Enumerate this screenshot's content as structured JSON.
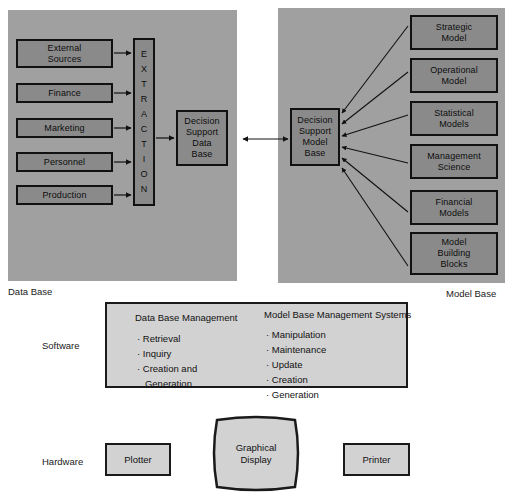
{
  "diagram": {
    "colors": {
      "panel_fill": "#a0a0a0",
      "dark_box_fill": "#8a8a8a",
      "light_box_fill": "#d2d2d2",
      "stroke": "#111111",
      "background": "#ffffff"
    }
  },
  "row_labels": {
    "software": "Software",
    "hardware": "Hardware"
  },
  "data_base": {
    "caption": "Data Base",
    "sources": [
      {
        "label_line1": "External",
        "label_line2": "Sources"
      },
      {
        "label_line1": "Finance",
        "label_line2": ""
      },
      {
        "label_line1": "Marketing",
        "label_line2": ""
      },
      {
        "label_line1": "Personnel",
        "label_line2": ""
      },
      {
        "label_line1": "Production",
        "label_line2": ""
      }
    ],
    "extraction": {
      "label": "EXTRACTION",
      "letters": [
        "E",
        "X",
        "T",
        "R",
        "A",
        "C",
        "T",
        "I",
        "O",
        "N"
      ]
    },
    "store": {
      "line1": "Decision",
      "line2": "Support",
      "line3": "Data",
      "line4": "Base"
    }
  },
  "model_base": {
    "caption": "Model Base",
    "store": {
      "line1": "Decision",
      "line2": "Support",
      "line3": "Model",
      "line4": "Base"
    },
    "models": [
      {
        "line1": "Strategic",
        "line2": "Model",
        "line3": ""
      },
      {
        "line1": "Operational",
        "line2": "Model",
        "line3": ""
      },
      {
        "line1": "Statistical",
        "line2": "Models",
        "line3": ""
      },
      {
        "line1": "Management",
        "line2": "Science",
        "line3": ""
      },
      {
        "line1": "Financial",
        "line2": "Models",
        "line3": ""
      },
      {
        "line1": "Model",
        "line2": "Building",
        "line3": "Blocks"
      }
    ]
  },
  "software": {
    "left_column": {
      "title": "Data Base Management",
      "items": [
        "Retrieval",
        "Inquiry",
        "Creation and",
        "Generation"
      ]
    },
    "right_column": {
      "title": "Model Base Management Systems",
      "items": [
        "Manipulation",
        "Maintenance",
        "Update",
        "Creation",
        "Generation"
      ]
    }
  },
  "hardware": {
    "plotter": "Plotter",
    "display_line1": "Graphical",
    "display_line2": "Display",
    "printer": "Printer"
  }
}
